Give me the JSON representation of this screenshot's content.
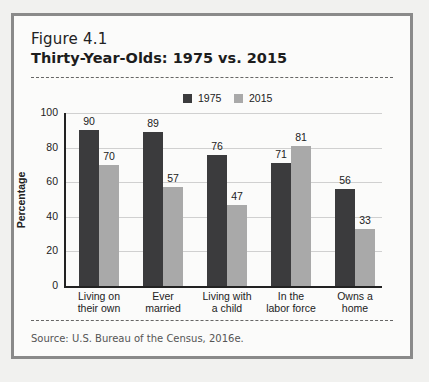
{
  "figure": {
    "label": "Figure 4.1",
    "title": "Thirty-Year-Olds: 1975 vs. 2015",
    "source": "Source: U.S. Bureau of the Census, 2016e."
  },
  "colors": {
    "series_1975": "#3b3b3d",
    "series_2015": "#a9a9a9",
    "frame": "#8a8a8a"
  },
  "chart_data": {
    "type": "bar",
    "title": "Thirty-Year-Olds: 1975 vs. 2015",
    "xlabel": "",
    "ylabel": "Percentage",
    "ylim": [
      0,
      100
    ],
    "yticks": [
      0,
      20,
      40,
      60,
      80,
      100
    ],
    "grid": true,
    "legend_position": "top",
    "categories": [
      "Living on their own",
      "Ever married",
      "Living with a child",
      "In the labor force",
      "Owns a home"
    ],
    "category_lines": [
      [
        "Living on",
        "their own"
      ],
      [
        "Ever",
        "married"
      ],
      [
        "Living with",
        "a child"
      ],
      [
        "In the",
        "labor force"
      ],
      [
        "Owns a",
        "home"
      ]
    ],
    "series": [
      {
        "name": "1975",
        "values": [
          90,
          89,
          76,
          71,
          56
        ]
      },
      {
        "name": "2015",
        "values": [
          70,
          57,
          47,
          81,
          33
        ]
      }
    ]
  }
}
